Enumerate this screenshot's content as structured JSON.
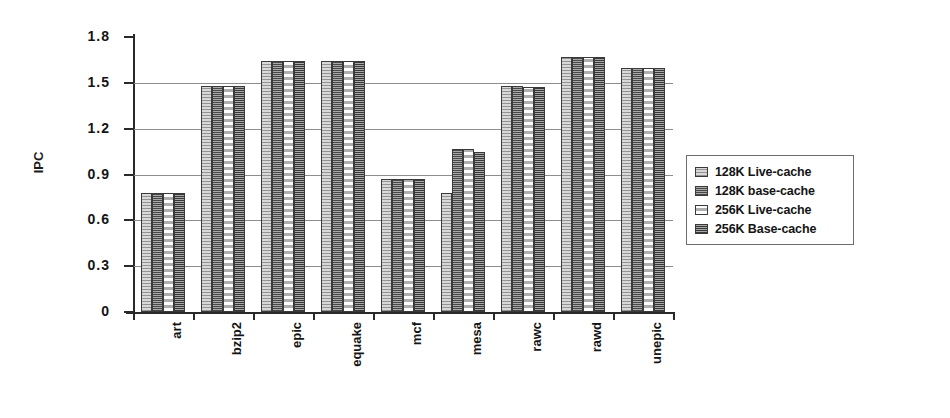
{
  "chart_data": {
    "type": "bar",
    "title": "",
    "xlabel": "",
    "ylabel": "IPC",
    "ylim": [
      0,
      1.8
    ],
    "yticks": [
      "0",
      "0.3",
      "0.6",
      "0.9",
      "1.2",
      "1.5",
      "1.8"
    ],
    "ytick_values": [
      0,
      0.3,
      0.6,
      0.9,
      1.2,
      1.5,
      1.8
    ],
    "grid": true,
    "legend_position": "right",
    "categories": [
      "art",
      "bzip2",
      "epic",
      "equake",
      "mcf",
      "mesa",
      "rawc",
      "rawd",
      "unepic"
    ],
    "series": [
      {
        "name": "128K Live-cache",
        "values": [
          0.78,
          1.48,
          1.64,
          1.64,
          0.87,
          0.78,
          1.48,
          1.67,
          1.6
        ]
      },
      {
        "name": "128K base-cache",
        "values": [
          0.78,
          1.48,
          1.64,
          1.64,
          0.87,
          1.07,
          1.48,
          1.67,
          1.6
        ]
      },
      {
        "name": "256K Live-cache",
        "values": [
          0.78,
          1.48,
          1.64,
          1.64,
          0.87,
          1.07,
          1.47,
          1.67,
          1.6
        ]
      },
      {
        "name": "256K Base-cache",
        "values": [
          0.78,
          1.48,
          1.64,
          1.64,
          0.87,
          1.05,
          1.47,
          1.67,
          1.6
        ]
      }
    ]
  },
  "legend": {
    "items": [
      {
        "label": "128K Live-cache",
        "pattern": "light-stipple"
      },
      {
        "label": "128K base-cache",
        "pattern": "dark-hatch"
      },
      {
        "label": "256K Live-cache",
        "pattern": "dotted-light"
      },
      {
        "label": "256K Base-cache",
        "pattern": "dense-hatch"
      }
    ]
  }
}
